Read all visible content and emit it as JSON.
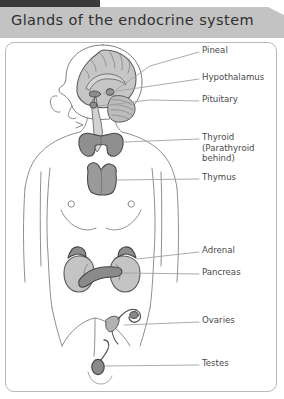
{
  "title": "Glands of the endocrine system",
  "colors": {
    "title_band": "#c3c3c3",
    "title_text": "#2f2f2f",
    "frame_border": "#b8b8b8",
    "label_text": "#4a4a4a",
    "leader_line": "#9a9a9a",
    "body_outline": "#8a8a8a",
    "gland_fill": "#9b9b9b",
    "gland_fill_light": "#c9c9c9",
    "brain_fill": "#c2c2c2",
    "top_bar": "#3a3a3a"
  },
  "labels": [
    {
      "id": "pineal",
      "text": "Pineal",
      "x": 202,
      "y": 49,
      "leader": true
    },
    {
      "id": "hypothalamus",
      "text": "Hypothalamus",
      "x": 202,
      "y": 75,
      "leader": true
    },
    {
      "id": "pituitary",
      "text": "Pituitary",
      "x": 202,
      "y": 99,
      "leader": true
    },
    {
      "id": "thyroid",
      "text": "Thyroid\n(Parathyroid\nbehind)",
      "x": 202,
      "y": 134,
      "leader": true
    },
    {
      "id": "thymus",
      "text": "Thymus",
      "x": 202,
      "y": 176,
      "leader": true
    },
    {
      "id": "adrenal",
      "text": "Adrenal",
      "x": 202,
      "y": 249,
      "leader": true
    },
    {
      "id": "pancreas",
      "text": "Pancreas",
      "x": 202,
      "y": 271,
      "leader": true
    },
    {
      "id": "ovaries",
      "text": "Ovaries",
      "x": 202,
      "y": 319,
      "leader": true
    },
    {
      "id": "testes",
      "text": "Testes",
      "x": 202,
      "y": 362,
      "leader": true
    }
  ],
  "glands": [
    {
      "id": "pineal",
      "name": "Pineal gland"
    },
    {
      "id": "hypothalamus",
      "name": "Hypothalamus"
    },
    {
      "id": "pituitary",
      "name": "Pituitary gland"
    },
    {
      "id": "thyroid",
      "name": "Thyroid gland"
    },
    {
      "id": "parathyroid",
      "name": "Parathyroid gland"
    },
    {
      "id": "thymus",
      "name": "Thymus"
    },
    {
      "id": "adrenal",
      "name": "Adrenal glands"
    },
    {
      "id": "pancreas",
      "name": "Pancreas"
    },
    {
      "id": "ovaries",
      "name": "Ovaries"
    },
    {
      "id": "testes",
      "name": "Testes"
    }
  ]
}
